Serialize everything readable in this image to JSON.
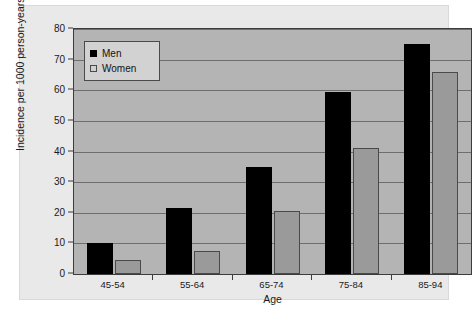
{
  "chart_data": {
    "type": "bar",
    "title": "",
    "xlabel": "Age",
    "ylabel": "Incidence per 1000 person-years",
    "categories": [
      "45-54",
      "55-64",
      "65-74",
      "75-84",
      "85-94"
    ],
    "series": [
      {
        "name": "Men",
        "color": "#000000",
        "values": [
          10,
          21.5,
          35,
          59.5,
          75
        ]
      },
      {
        "name": "Women",
        "color": "#9a9a9a",
        "values": [
          4.5,
          7.5,
          20.5,
          41,
          66
        ]
      }
    ],
    "ylim": [
      0,
      80
    ],
    "yticks": [
      0,
      10,
      20,
      30,
      40,
      50,
      60,
      70,
      80
    ],
    "ytick_labels": [
      "0",
      "10",
      "20",
      "30",
      "40",
      "50",
      "60",
      "70",
      "80"
    ],
    "grid": true,
    "legend_position": "top-left",
    "plot_background": "#b4b4b4",
    "figure_background": "#e9e9e9",
    "gridline_color": "#6e6e6e",
    "axis_color": "#3c3c3c"
  },
  "legend": {
    "items": [
      {
        "label": "Men"
      },
      {
        "label": "Women"
      }
    ]
  }
}
